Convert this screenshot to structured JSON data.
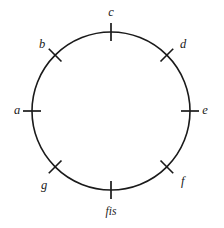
{
  "figure": {
    "type": "circle-diagram",
    "title": "",
    "background_color": "#ffffff",
    "stroke_color": "#1a1a1a",
    "geometry": {
      "center_x": 111,
      "center_y": 111,
      "radius": 79,
      "tick_inner_offset": 9,
      "tick_outer_offset": 9,
      "tick_count": 8,
      "tick_spacing_degrees": 45
    },
    "nodes": [
      {
        "id": "node-c",
        "label": "c",
        "angle_degrees": 90,
        "position": "top",
        "tick_orientation": "vertical",
        "label_x": 111,
        "label_y": 13,
        "label_anchor": "middle"
      },
      {
        "id": "node-d",
        "label": "d",
        "angle_degrees": 45,
        "position": "upper-right",
        "tick_orientation": "diagonal",
        "label_x": 180,
        "label_y": 45,
        "label_anchor": "start"
      },
      {
        "id": "node-e",
        "label": "e",
        "angle_degrees": 0,
        "position": "right",
        "tick_orientation": "horizontal",
        "label_x": 205,
        "label_y": 111,
        "label_anchor": "middle"
      },
      {
        "id": "node-f",
        "label": "f",
        "angle_degrees": -45,
        "position": "lower-right",
        "tick_orientation": "diagonal",
        "label_x": 181,
        "label_y": 182,
        "label_anchor": "start"
      },
      {
        "id": "node-fis",
        "label": "fis",
        "angle_degrees": -90,
        "position": "bottom",
        "tick_orientation": "vertical",
        "label_x": 111,
        "label_y": 212,
        "label_anchor": "middle"
      },
      {
        "id": "node-g",
        "label": "g",
        "angle_degrees": -135,
        "position": "lower-left",
        "tick_orientation": "diagonal",
        "label_x": 44,
        "label_y": 186,
        "label_anchor": "middle"
      },
      {
        "id": "node-a",
        "label": "a",
        "angle_degrees": 180,
        "position": "left",
        "tick_orientation": "horizontal",
        "label_x": 17,
        "label_y": 111,
        "label_anchor": "middle"
      },
      {
        "id": "node-b",
        "label": "b",
        "angle_degrees": 135,
        "position": "upper-left",
        "tick_orientation": "diagonal",
        "label_x": 42,
        "label_y": 45,
        "label_anchor": "middle"
      }
    ]
  }
}
